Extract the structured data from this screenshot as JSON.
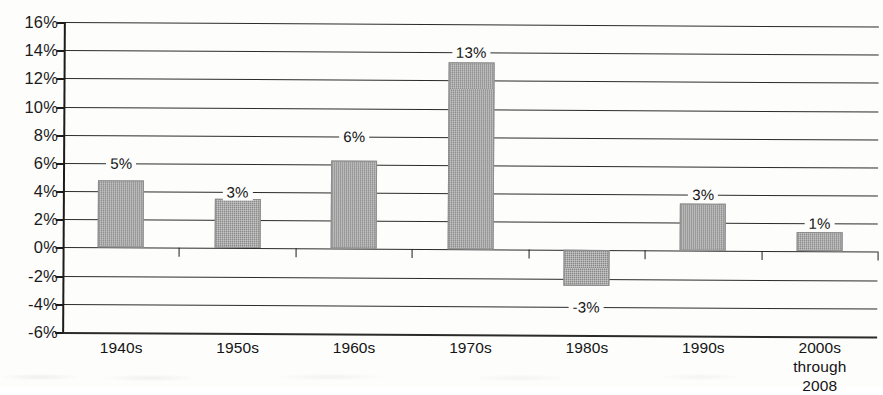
{
  "chart_data": {
    "type": "bar",
    "title": "",
    "xlabel": "",
    "ylabel": "",
    "categories": [
      "1940s",
      "1950s",
      "1960s",
      "1970s",
      "1980s",
      "1990s",
      "2000s through\n2008"
    ],
    "values": [
      4.8,
      3.5,
      6.3,
      13.3,
      -2.5,
      3.4,
      1.4
    ],
    "data_labels": [
      "5%",
      "3%",
      "6%",
      "13%",
      "-3%",
      "3%",
      "1%"
    ],
    "ylim": [
      -6,
      16
    ],
    "ytick_step": 2,
    "ytick_labels": [
      "16%",
      "14%",
      "12%",
      "10%",
      "8%",
      "6%",
      "4%",
      "2%",
      "0%",
      "-2%",
      "-4%",
      "-6%"
    ],
    "ytick_values": [
      16,
      14,
      12,
      10,
      8,
      6,
      4,
      2,
      0,
      -2,
      -4,
      -6
    ],
    "grid": true,
    "legend": "none",
    "bar_color": "#9c9c9c",
    "axis_color": "#1c1c1c",
    "background_color": "#fdfdfc",
    "label_gridline_values": [
      6,
      4,
      8,
      14,
      -4,
      4,
      2
    ]
  }
}
